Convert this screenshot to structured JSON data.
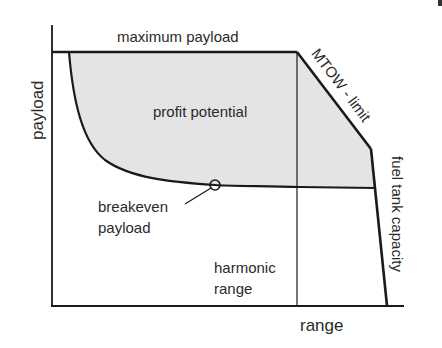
{
  "diagram": {
    "axes": {
      "x_label": "range",
      "y_label": "payload"
    },
    "labels": {
      "maximum_payload": "maximum payload",
      "profit_potential": "profit potential",
      "mtow_limit": "MTOW - limit",
      "fuel_tank_capacity": "fuel tank capacity",
      "breakeven_line1": "breakeven",
      "breakeven_line2": "payload",
      "harmonic_line1": "harmonic",
      "harmonic_line2": "range"
    },
    "colors": {
      "line": "#1a1a1a",
      "fill": "#e4e4e4",
      "background": "#ffffff"
    }
  }
}
